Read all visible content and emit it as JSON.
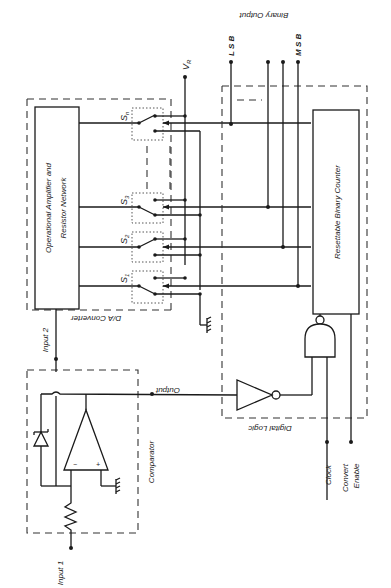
{
  "diagram": {
    "colors": {
      "line": "#1a1a1a",
      "background": "#ffffff"
    },
    "blocks": {
      "opamp_network": {
        "line1": "Operational Amplifier and",
        "line2": "Resistor Network"
      },
      "counter": {
        "label": "Resettable Binary Counter"
      }
    },
    "groups": {
      "dac": "D/A Converter",
      "comparator": "Comparator",
      "digital_logic": "Digital Logic"
    },
    "switches": [
      {
        "name": "S",
        "sub": "n"
      },
      {
        "name": "S",
        "sub": "3"
      },
      {
        "name": "S",
        "sub": "2"
      },
      {
        "name": "S",
        "sub": "1"
      }
    ],
    "reference": {
      "name": "V",
      "sub": "R"
    },
    "signals": {
      "input1": "Input 1",
      "input2": "Input 2",
      "output": "Output",
      "clock": "Clock",
      "convert_enable_1": "Convert",
      "convert_enable_2": "Enable"
    },
    "binary_output": {
      "label": "Binary Output",
      "lsb": "L S B",
      "msb": "M S B"
    },
    "opamp_pins": {
      "minus": "−",
      "plus": "+"
    }
  }
}
